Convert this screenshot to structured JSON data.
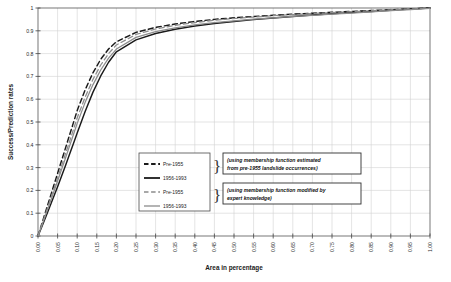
{
  "chart_data": {
    "type": "line",
    "title": "",
    "xlabel": "Area in percentage",
    "ylabel": "Success/Prediction rates",
    "xlim": [
      0,
      1
    ],
    "ylim": [
      0,
      1
    ],
    "grid": true,
    "legend_position": "bottom-center-inside",
    "xticks": [
      "0.00",
      "0.05",
      "0.10",
      "0.15",
      "0.20",
      "0.25",
      "0.30",
      "0.35",
      "0.40",
      "0.45",
      "0.50",
      "0.55",
      "0.60",
      "0.65",
      "0.70",
      "0.75",
      "0.80",
      "0.85",
      "0.90",
      "0.95",
      "1.00"
    ],
    "yticks": [
      "0",
      "0.1",
      "0.2",
      "0.3",
      "0.4",
      "0.5",
      "0.6",
      "0.7",
      "0.8",
      "0.9",
      "1"
    ],
    "x": [
      0,
      0.01,
      0.02,
      0.03,
      0.04,
      0.05,
      0.06,
      0.07,
      0.08,
      0.09,
      0.1,
      0.12,
      0.14,
      0.16,
      0.18,
      0.2,
      0.25,
      0.3,
      0.35,
      0.4,
      0.45,
      0.5,
      0.55,
      0.6,
      0.65,
      0.7,
      0.75,
      0.8,
      0.85,
      0.9,
      0.95,
      1.0
    ],
    "series": [
      {
        "name": "Pre-1955",
        "group": "estimated",
        "color": "#1a1a1a",
        "style": "dashed",
        "values": [
          0,
          0.055,
          0.11,
          0.165,
          0.22,
          0.275,
          0.33,
          0.385,
          0.44,
          0.495,
          0.55,
          0.64,
          0.715,
          0.775,
          0.82,
          0.852,
          0.893,
          0.915,
          0.93,
          0.941,
          0.95,
          0.957,
          0.963,
          0.968,
          0.973,
          0.977,
          0.981,
          0.985,
          0.989,
          0.992,
          0.996,
          1.0
        ]
      },
      {
        "name": "1956-1993",
        "group": "estimated",
        "color": "#1a1a1a",
        "style": "solid",
        "values": [
          0,
          0.042,
          0.085,
          0.128,
          0.172,
          0.216,
          0.262,
          0.308,
          0.356,
          0.404,
          0.452,
          0.545,
          0.63,
          0.702,
          0.762,
          0.808,
          0.86,
          0.888,
          0.907,
          0.921,
          0.932,
          0.941,
          0.949,
          0.956,
          0.963,
          0.969,
          0.975,
          0.98,
          0.985,
          0.99,
          0.995,
          1.0
        ]
      },
      {
        "name": "Pre-1955",
        "group": "expert",
        "color": "#8c8c8c",
        "style": "dashed",
        "values": [
          0,
          0.05,
          0.101,
          0.152,
          0.203,
          0.255,
          0.307,
          0.36,
          0.412,
          0.465,
          0.518,
          0.608,
          0.686,
          0.75,
          0.8,
          0.838,
          0.884,
          0.908,
          0.924,
          0.936,
          0.946,
          0.954,
          0.96,
          0.966,
          0.971,
          0.976,
          0.98,
          0.984,
          0.988,
          0.992,
          0.996,
          1.0
        ]
      },
      {
        "name": "1956-1993",
        "group": "expert",
        "color": "#8c8c8c",
        "style": "solid",
        "values": [
          0,
          0.047,
          0.095,
          0.143,
          0.192,
          0.241,
          0.291,
          0.341,
          0.392,
          0.443,
          0.494,
          0.585,
          0.663,
          0.728,
          0.78,
          0.82,
          0.871,
          0.896,
          0.913,
          0.926,
          0.936,
          0.944,
          0.951,
          0.957,
          0.963,
          0.968,
          0.973,
          0.978,
          0.983,
          0.988,
          0.993,
          0.998
        ]
      }
    ],
    "legend": {
      "entries": [
        {
          "label": "Pre-1955",
          "color": "#1a1a1a",
          "style": "dashed"
        },
        {
          "label": "1956-1993",
          "color": "#1a1a1a",
          "style": "solid"
        },
        {
          "label": "Pre-1955",
          "color": "#8c8c8c",
          "style": "dashed"
        },
        {
          "label": "1956-1993",
          "color": "#8c8c8c",
          "style": "solid"
        }
      ]
    },
    "annotations": [
      {
        "line1": "(using membership function estimated",
        "line2": "from pre-1955 landslide occurrences)"
      },
      {
        "line1": "(using membership function modified by",
        "line2": "expert knowledge)"
      }
    ]
  },
  "caption": ""
}
